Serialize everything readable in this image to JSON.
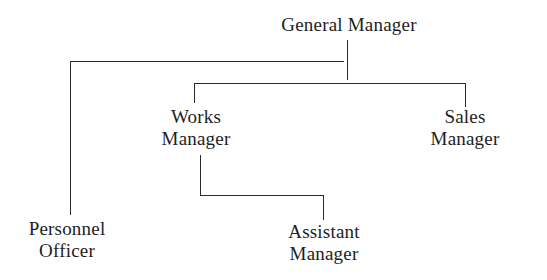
{
  "chart_title": "",
  "nodes": {
    "general_manager": {
      "line1": "General Manager",
      "line2": ""
    },
    "works_manager": {
      "line1": "Works",
      "line2": "Manager"
    },
    "sales_manager": {
      "line1": "Sales",
      "line2": "Manager"
    },
    "personnel_officer": {
      "line1": "Personnel",
      "line2": "Officer"
    },
    "assistant_manager": {
      "line1": "Assistant",
      "line2": "Manager"
    }
  },
  "hierarchy": [
    {
      "node": "General Manager",
      "reports_to": null
    },
    {
      "node": "Personnel Officer",
      "reports_to": "General Manager"
    },
    {
      "node": "Works Manager",
      "reports_to": "General Manager"
    },
    {
      "node": "Sales Manager",
      "reports_to": "General Manager"
    },
    {
      "node": "Assistant Manager",
      "reports_to": "Works Manager"
    }
  ],
  "colors": {
    "background": "#ffffff",
    "text": "#1e1e1e",
    "lines": "#2a2a2a"
  }
}
